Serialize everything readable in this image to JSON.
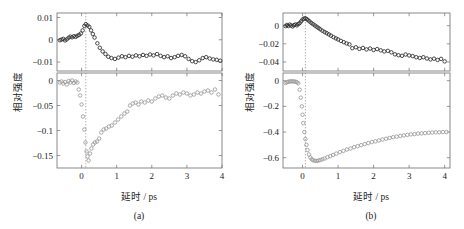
{
  "figure": {
    "panels": [
      {
        "id": "a",
        "caption": "(a)"
      },
      {
        "id": "b",
        "caption": "(b)"
      }
    ]
  },
  "chart_data": [
    {
      "type": "scatter",
      "panel": "(a)",
      "title": "",
      "xlabel": "延时 / ps",
      "ylabel": "相对强度",
      "xlim": [
        -0.7,
        4.0
      ],
      "xticks": [
        0,
        1,
        2,
        3,
        4
      ],
      "xticklabels": [
        "0",
        "1",
        "2",
        "3",
        "4"
      ],
      "grid": false,
      "legend": null,
      "annotations": [
        {
          "kind": "vertical-dotted-line",
          "x": 0.12,
          "label": "time-zero marker"
        }
      ],
      "subplots": [
        {
          "position": "top",
          "ylim": [
            -0.014,
            0.012
          ],
          "yticks": [
            0.01,
            0,
            -0.01
          ],
          "yticklabels": [
            "0.01",
            "0",
            "-0.01"
          ],
          "marker": "open-circle",
          "color": "#2b2b2b",
          "x": [
            -0.62,
            -0.57,
            -0.52,
            -0.47,
            -0.42,
            -0.37,
            -0.32,
            -0.27,
            -0.22,
            -0.17,
            -0.12,
            -0.07,
            -0.02,
            0.03,
            0.08,
            0.12,
            0.17,
            0.22,
            0.27,
            0.32,
            0.37,
            0.45,
            0.52,
            0.6,
            0.68,
            0.76,
            0.85,
            0.95,
            1.05,
            1.15,
            1.25,
            1.35,
            1.45,
            1.55,
            1.65,
            1.75,
            1.85,
            1.95,
            2.05,
            2.15,
            2.25,
            2.35,
            2.45,
            2.55,
            2.65,
            2.75,
            2.85,
            2.95,
            3.05,
            3.15,
            3.25,
            3.35,
            3.45,
            3.55,
            3.65,
            3.75,
            3.85,
            3.95
          ],
          "y": [
            -0.0002,
            0.0001,
            0.0004,
            -0.0003,
            0.0002,
            0.0009,
            0.0014,
            0.0011,
            0.0016,
            0.0013,
            0.0018,
            0.0022,
            0.0028,
            0.0042,
            0.0062,
            0.007,
            0.0064,
            0.0058,
            0.0042,
            0.0026,
            0.001,
            -0.0016,
            -0.0036,
            -0.0052,
            -0.0064,
            -0.0076,
            -0.0082,
            -0.0086,
            -0.008,
            -0.0074,
            -0.0078,
            -0.0072,
            -0.0076,
            -0.007,
            -0.0074,
            -0.0068,
            -0.0072,
            -0.0066,
            -0.007,
            -0.0064,
            -0.0072,
            -0.0078,
            -0.0074,
            -0.0082,
            -0.0078,
            -0.0072,
            -0.0068,
            -0.0074,
            -0.0086,
            -0.0096,
            -0.01,
            -0.0092,
            -0.0082,
            -0.0078,
            -0.0084,
            -0.0088,
            -0.009,
            -0.0094
          ]
        },
        {
          "position": "bottom",
          "ylim": [
            -0.175,
            0.015
          ],
          "yticks": [
            0,
            -0.05,
            -0.1,
            -0.15
          ],
          "yticklabels": [
            "0",
            "-0.05",
            "-0.1",
            "-0.15"
          ],
          "marker": "open-circle",
          "color": "#9a9a9a",
          "x": [
            -0.62,
            -0.57,
            -0.52,
            -0.47,
            -0.42,
            -0.37,
            -0.32,
            -0.27,
            -0.22,
            -0.17,
            -0.12,
            -0.08,
            -0.04,
            0.0,
            0.04,
            0.08,
            0.11,
            0.14,
            0.17,
            0.2,
            0.24,
            0.28,
            0.33,
            0.38,
            0.44,
            0.5,
            0.56,
            0.63,
            0.7,
            0.78,
            0.86,
            0.95,
            1.04,
            1.13,
            1.22,
            1.3,
            1.38,
            1.46,
            1.54,
            1.62,
            1.7,
            1.8,
            1.9,
            2.0,
            2.1,
            2.2,
            2.3,
            2.4,
            2.5,
            2.6,
            2.7,
            2.8,
            2.9,
            3.0,
            3.1,
            3.2,
            3.3,
            3.4,
            3.5,
            3.6,
            3.7,
            3.8,
            3.9
          ],
          "y": [
            -0.004,
            -0.002,
            -0.006,
            -0.003,
            -0.008,
            -0.001,
            -0.004,
            0.0,
            -0.005,
            -0.002,
            -0.004,
            -0.018,
            -0.03,
            -0.048,
            -0.072,
            -0.098,
            -0.124,
            -0.142,
            -0.152,
            -0.16,
            -0.146,
            -0.136,
            -0.128,
            -0.124,
            -0.122,
            -0.116,
            -0.104,
            -0.098,
            -0.096,
            -0.092,
            -0.09,
            -0.084,
            -0.078,
            -0.072,
            -0.066,
            -0.062,
            -0.05,
            -0.046,
            -0.044,
            -0.048,
            -0.042,
            -0.044,
            -0.04,
            -0.042,
            -0.036,
            -0.032,
            -0.03,
            -0.034,
            -0.036,
            -0.03,
            -0.026,
            -0.028,
            -0.024,
            -0.026,
            -0.03,
            -0.028,
            -0.024,
            -0.026,
            -0.022,
            -0.02,
            -0.024,
            -0.018,
            -0.028
          ]
        }
      ]
    },
    {
      "type": "scatter",
      "panel": "(b)",
      "title": "",
      "xlabel": "延时 / ps",
      "ylabel": "相对强度",
      "xlim": [
        -0.55,
        4.15
      ],
      "xticks": [
        0,
        1,
        2,
        3,
        4
      ],
      "xticklabels": [
        "0",
        "1",
        "2",
        "3",
        "4"
      ],
      "grid": false,
      "legend": null,
      "annotations": [
        {
          "kind": "vertical-dotted-line",
          "x": 0.08,
          "label": "time-zero marker"
        }
      ],
      "subplots": [
        {
          "position": "top",
          "ylim": [
            -0.05,
            0.014
          ],
          "yticks": [
            0,
            -0.02,
            -0.04
          ],
          "yticklabels": [
            "0",
            "-0.02",
            "-0.04"
          ],
          "marker": "open-circle",
          "color": "#2b2b2b",
          "x": [
            -0.48,
            -0.44,
            -0.4,
            -0.36,
            -0.32,
            -0.28,
            -0.24,
            -0.2,
            -0.16,
            -0.12,
            -0.08,
            -0.04,
            0.0,
            0.04,
            0.08,
            0.12,
            0.16,
            0.2,
            0.25,
            0.3,
            0.35,
            0.4,
            0.45,
            0.5,
            0.56,
            0.62,
            0.68,
            0.74,
            0.8,
            0.87,
            0.94,
            1.0,
            1.08,
            1.16,
            1.24,
            1.32,
            1.4,
            1.5,
            1.6,
            1.7,
            1.8,
            1.9,
            2.0,
            2.1,
            2.2,
            2.3,
            2.4,
            2.5,
            2.6,
            2.7,
            2.8,
            2.9,
            3.0,
            3.1,
            3.2,
            3.3,
            3.4,
            3.5,
            3.6,
            3.7,
            3.8,
            3.9,
            4.0
          ],
          "y": [
            -0.0005,
            0.0008,
            -0.0004,
            0.0012,
            0.0002,
            -0.0008,
            0.0006,
            0.0014,
            0.0004,
            0.0018,
            0.0028,
            0.0048,
            0.0068,
            0.0078,
            0.0082,
            0.0072,
            0.006,
            0.0046,
            0.003,
            0.0016,
            0.0002,
            -0.0012,
            -0.0026,
            -0.004,
            -0.0056,
            -0.007,
            -0.0082,
            -0.0096,
            -0.011,
            -0.0126,
            -0.014,
            -0.0152,
            -0.0168,
            -0.0182,
            -0.0196,
            -0.0206,
            -0.0248,
            -0.0238,
            -0.0256,
            -0.0246,
            -0.0262,
            -0.0252,
            -0.0268,
            -0.0258,
            -0.0272,
            -0.0284,
            -0.0278,
            -0.0294,
            -0.0316,
            -0.0326,
            -0.0332,
            -0.0318,
            -0.0328,
            -0.0336,
            -0.0348,
            -0.0356,
            -0.0348,
            -0.0362,
            -0.0372,
            -0.0364,
            -0.0378,
            -0.0366,
            -0.0394
          ]
        },
        {
          "position": "bottom",
          "ylim": [
            -0.68,
            0.06
          ],
          "yticks": [
            0,
            -0.2,
            -0.4,
            -0.6
          ],
          "yticklabels": [
            "0",
            "-0.2",
            "-0.4",
            "-0.6"
          ],
          "marker": "open-circle",
          "color": "#9a9a9a",
          "x": [
            -0.48,
            -0.44,
            -0.4,
            -0.36,
            -0.32,
            -0.28,
            -0.24,
            -0.2,
            -0.16,
            -0.12,
            -0.08,
            -0.05,
            -0.02,
            0.0,
            0.02,
            0.05,
            0.08,
            0.11,
            0.14,
            0.18,
            0.22,
            0.26,
            0.3,
            0.35,
            0.4,
            0.45,
            0.5,
            0.56,
            0.62,
            0.7,
            0.78,
            0.86,
            0.95,
            1.05,
            1.15,
            1.25,
            1.35,
            1.45,
            1.55,
            1.65,
            1.75,
            1.85,
            1.95,
            2.05,
            2.15,
            2.25,
            2.35,
            2.45,
            2.55,
            2.65,
            2.75,
            2.85,
            2.95,
            3.05,
            3.15,
            3.25,
            3.35,
            3.45,
            3.55,
            3.65,
            3.75,
            3.85,
            3.95,
            4.05
          ],
          "y": [
            -0.018,
            -0.012,
            -0.008,
            -0.006,
            -0.005,
            -0.005,
            -0.006,
            -0.008,
            -0.012,
            -0.02,
            -0.07,
            -0.132,
            -0.2,
            -0.265,
            -0.33,
            -0.4,
            -0.455,
            -0.5,
            -0.54,
            -0.575,
            -0.598,
            -0.612,
            -0.62,
            -0.624,
            -0.625,
            -0.622,
            -0.618,
            -0.612,
            -0.606,
            -0.596,
            -0.588,
            -0.578,
            -0.568,
            -0.556,
            -0.546,
            -0.536,
            -0.528,
            -0.518,
            -0.51,
            -0.502,
            -0.494,
            -0.486,
            -0.478,
            -0.472,
            -0.466,
            -0.458,
            -0.452,
            -0.446,
            -0.44,
            -0.436,
            -0.43,
            -0.426,
            -0.422,
            -0.418,
            -0.416,
            -0.412,
            -0.41,
            -0.408,
            -0.406,
            -0.404,
            -0.402,
            -0.402,
            -0.4,
            -0.4
          ]
        }
      ]
    }
  ]
}
